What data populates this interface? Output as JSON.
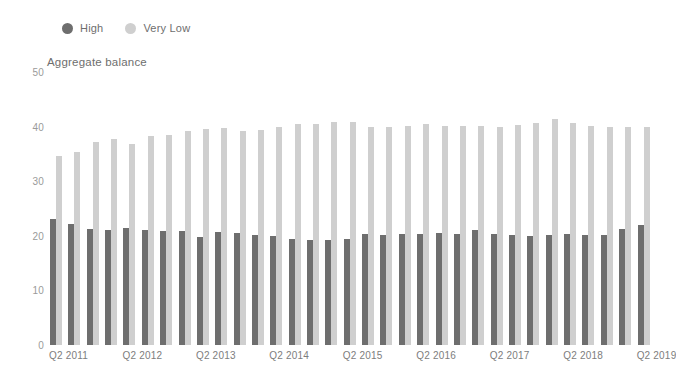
{
  "chart_data": {
    "type": "bar",
    "title": "Aggregate balance",
    "xlabel": "",
    "ylabel": "",
    "ylim": [
      0,
      50
    ],
    "yticks": [
      0,
      10,
      20,
      30,
      40,
      50
    ],
    "grid": false,
    "legend_position": "top-left",
    "colors": {
      "high": "#6e6e6e",
      "very_low": "#cfcfcf"
    },
    "categories": [
      "Q2 2011",
      "Q3 2011",
      "Q4 2011",
      "Q1 2012",
      "Q2 2012",
      "Q3 2012",
      "Q4 2012",
      "Q1 2013",
      "Q2 2013",
      "Q3 2013",
      "Q4 2013",
      "Q1 2014",
      "Q2 2014",
      "Q3 2014",
      "Q4 2014",
      "Q1 2015",
      "Q2 2015",
      "Q3 2015",
      "Q4 2015",
      "Q1 2016",
      "Q2 2016",
      "Q3 2016",
      "Q4 2016",
      "Q1 2017",
      "Q2 2017",
      "Q3 2017",
      "Q4 2017",
      "Q1 2018",
      "Q2 2018",
      "Q3 2018",
      "Q4 2018",
      "Q1 2019",
      "Q2 2019"
    ],
    "tick_labels": [
      "Q2 2011",
      "Q2 2012",
      "Q2 2013",
      "Q2 2014",
      "Q2 2015",
      "Q2 2016",
      "Q2 2017",
      "Q2 2018",
      "Q2 2019"
    ],
    "tick_label_indices": [
      0,
      4,
      8,
      12,
      16,
      20,
      24,
      28,
      32
    ],
    "series": [
      {
        "name": "High",
        "color": "#6e6e6e",
        "values": [
          23.0,
          22.2,
          21.2,
          21.0,
          21.4,
          21.0,
          20.8,
          20.8,
          19.7,
          20.7,
          20.6,
          20.2,
          20.0,
          19.5,
          19.2,
          19.3,
          19.5,
          20.4,
          20.2,
          20.3,
          20.4,
          20.5,
          20.4,
          21.0,
          20.4,
          20.1,
          19.9,
          20.2,
          20.4,
          20.2,
          20.2,
          21.2,
          22.0
        ]
      },
      {
        "name": "Very Low",
        "color": "#cfcfcf",
        "values": [
          34.6,
          35.4,
          37.2,
          37.7,
          36.8,
          38.2,
          38.4,
          39.2,
          39.5,
          39.7,
          39.2,
          39.4,
          39.9,
          40.5,
          40.4,
          40.9,
          40.8,
          40.0,
          40.0,
          40.2,
          40.5,
          40.1,
          40.2,
          40.1,
          40.0,
          40.3,
          40.6,
          41.4,
          40.6,
          40.2,
          40.0,
          40.0,
          40.0
        ]
      }
    ]
  }
}
